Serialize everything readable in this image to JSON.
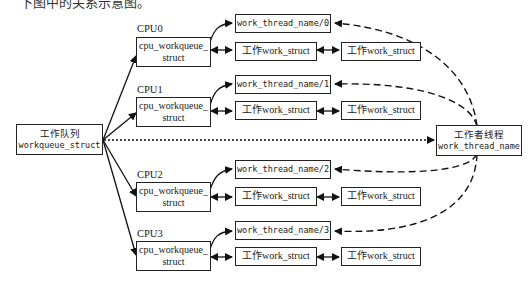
{
  "caption": "下图中的关系示意图。",
  "workqueue": {
    "title": "工作队列",
    "name": "workqueue_struct"
  },
  "worker": {
    "title": "工作者线程",
    "name": "work_thread_name"
  },
  "cpus": [
    {
      "label": "CPU0",
      "struct_line1": "cpu_workqueue_",
      "struct_line2": "struct",
      "thread": "work_thread_name/0",
      "work1": "工作work_struct",
      "work2": "工作work_struct"
    },
    {
      "label": "CPU1",
      "struct_line1": "cpu_workqueue_",
      "struct_line2": "struct",
      "thread": "work_thread_name/1",
      "work1": "工作work_struct",
      "work2": "工作work_struct"
    },
    {
      "label": "CPU2",
      "struct_line1": "cpu_workqueue_",
      "struct_line2": "struct",
      "thread": "work_thread_name/2",
      "work1": "工作work_struct",
      "work2": "工作work_struct"
    },
    {
      "label": "CPU3",
      "struct_line1": "cpu_workqueue_",
      "struct_line2": "struct",
      "thread": "work_thread_name/3",
      "work1": "工作work_struct",
      "work2": "工作work_struct"
    }
  ]
}
